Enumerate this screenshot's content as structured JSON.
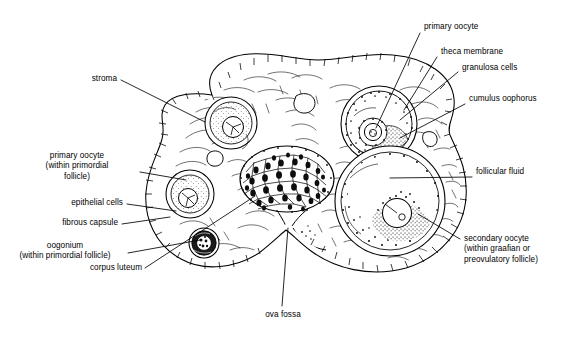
{
  "figure": {
    "type": "anatomical-line-diagram",
    "background_color": "#ffffff",
    "ink_color": "#000000"
  },
  "labels": {
    "stroma": "stroma",
    "primary_oocyte_primordial": "primary oocyte\n(within primordial\nfollicle)",
    "epithelial_cells": "epithelial cells",
    "fibrous_capsule": "fibrous capsule",
    "oogonium": "oogonium\n(within primordial follicle)",
    "corpus_luteum": "corpus luteum",
    "ova_fossa": "ova fossa",
    "primary_oocyte": "primary oocyte",
    "theca_membrane": "theca membrane",
    "granulosa_cells": "granulosa cells",
    "cumulus_oophorus": "cumulus oophorus",
    "follicular_fluid": "follicular fluid",
    "secondary_oocyte": "secondary oocyte\n(within graafian or\npreovulatory follicle)"
  },
  "structures": [
    {
      "name": "germinal-epithelium",
      "description": "outer band of small cuboidal cells around the ovary"
    },
    {
      "name": "fibrous-capsule",
      "description": "tunica albuginea beneath epithelium"
    },
    {
      "name": "stroma",
      "description": "fibrous connective tissue filling the ovary interior"
    },
    {
      "name": "primordial-follicle-upper",
      "description": "follicle with primary oocyte, upper left"
    },
    {
      "name": "primordial-follicle-lower",
      "description": "follicle with primary oocyte, mid left"
    },
    {
      "name": "oogonium",
      "description": "small dark primordial follicle, lower left"
    },
    {
      "name": "corpus-luteum",
      "description": "dense lobulated body at center"
    },
    {
      "name": "developing-follicle",
      "description": "upper right follicle with theca, granulosa, oocyte"
    },
    {
      "name": "graafian-follicle",
      "description": "large lower right follicle with antrum and cumulus oophorus"
    },
    {
      "name": "ova-fossa",
      "description": "notch at bottom center of ovary"
    }
  ]
}
